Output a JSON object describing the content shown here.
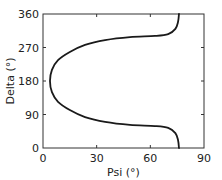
{
  "chart_data": {
    "type": "line",
    "title": "",
    "xlabel": "Psi (°)",
    "ylabel": "Delta (°)",
    "xlim": [
      0,
      90
    ],
    "ylim": [
      0,
      360
    ],
    "xticks": [
      0,
      30,
      60,
      90
    ],
    "yticks": [
      0,
      90,
      180,
      270,
      360
    ],
    "xtick_labels": [
      "0",
      "30",
      "60",
      "90"
    ],
    "ytick_labels": [
      "0",
      "90",
      "180",
      "270",
      "360"
    ],
    "grid": false,
    "legend": null,
    "series": [
      {
        "name": "Psi-Delta trajectory",
        "color": "#1a1a1a",
        "points": [
          [
            76,
            0
          ],
          [
            75.5,
            21
          ],
          [
            74,
            40
          ],
          [
            70,
            54
          ],
          [
            62.6,
            59
          ],
          [
            48.6,
            62
          ],
          [
            34.7,
            70
          ],
          [
            23.5,
            83
          ],
          [
            15,
            102
          ],
          [
            8.4,
            124
          ],
          [
            5,
            150
          ],
          [
            3.9,
            180
          ],
          [
            5,
            210
          ],
          [
            8.4,
            236
          ],
          [
            15,
            258
          ],
          [
            23.5,
            277
          ],
          [
            34.7,
            290
          ],
          [
            48.6,
            298
          ],
          [
            62.6,
            301
          ],
          [
            70,
            306
          ],
          [
            74,
            320
          ],
          [
            75.5,
            339
          ],
          [
            76,
            360
          ]
        ]
      }
    ]
  }
}
